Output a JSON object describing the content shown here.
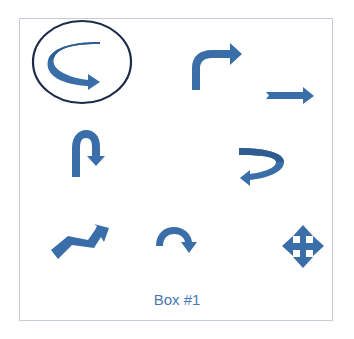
{
  "box": {
    "caption": "Box #1",
    "border_color": "#c5cdd8"
  },
  "colors": {
    "arrow": "#3a6ea8",
    "arrow_dark": "#2f5d92",
    "highlight_circle": "#1d2a4a",
    "caption": "#4a78b0"
  },
  "arrows": [
    {
      "name": "curved-u-right-arrow",
      "circled": true
    },
    {
      "name": "bent-up-right-arrow",
      "circled": false
    },
    {
      "name": "notched-right-arrow",
      "circled": false
    },
    {
      "name": "u-turn-down-arrow",
      "circled": false
    },
    {
      "name": "curved-u-left-arrow",
      "circled": false
    },
    {
      "name": "zigzag-up-right-arrow",
      "circled": false
    },
    {
      "name": "circular-clockwise-arrow",
      "circled": false
    },
    {
      "name": "four-way-move-arrow",
      "circled": false
    }
  ]
}
